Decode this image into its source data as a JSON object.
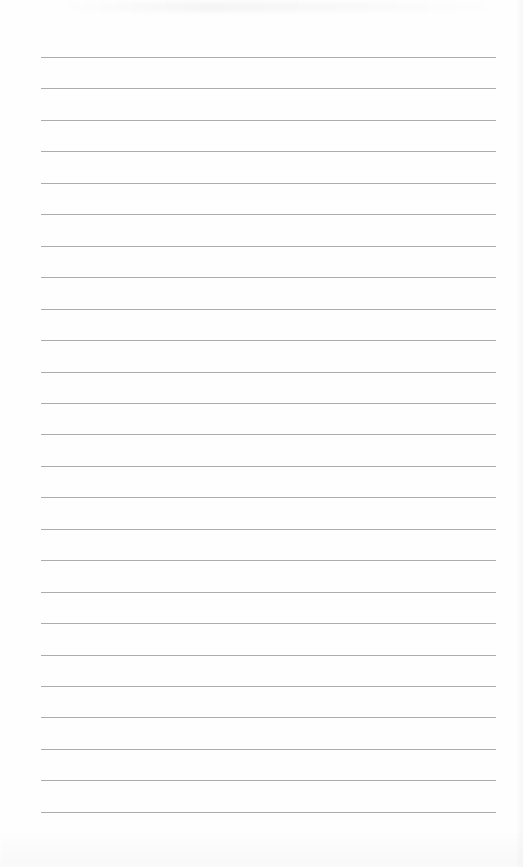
{
  "page": {
    "type": "lined-paper",
    "background": "#fefefe",
    "rule_color": "#9d9d9d",
    "rule_count": 25,
    "first_rule_y": 57,
    "rule_spacing": 31.45,
    "rule_left": 41,
    "rule_width": 455
  }
}
